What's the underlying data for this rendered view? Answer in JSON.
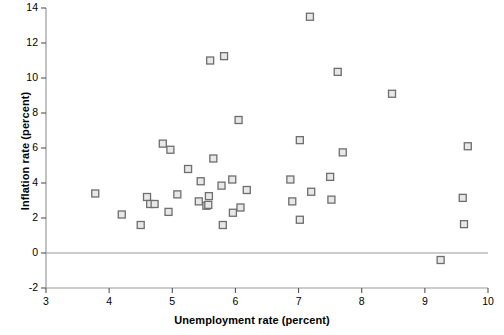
{
  "chart_data": {
    "type": "scatter",
    "title": "",
    "xlabel": "Unemployment rate (percent)",
    "ylabel": "Inflation rate (percent)",
    "xlim": [
      3,
      10
    ],
    "ylim": [
      -2,
      14
    ],
    "xticks": [
      3,
      4,
      5,
      6,
      7,
      8,
      9,
      10
    ],
    "yticks": [
      -2,
      0,
      2,
      4,
      6,
      8,
      10,
      12,
      14
    ],
    "xtick_labels": [
      "3",
      "4",
      "5",
      "6",
      "7",
      "8",
      "9",
      "10"
    ],
    "ytick_labels": [
      "-2",
      "0",
      "2",
      "4",
      "6",
      "8",
      "10",
      "12",
      "14"
    ],
    "grid": false,
    "legend": null,
    "marker": "square",
    "marker_face_color": "#e8e8e8",
    "marker_edge_color": "#6e6e6e",
    "axis_color": "#999999",
    "zero_line": 0,
    "points": [
      {
        "x": 3.78,
        "y": 3.4
      },
      {
        "x": 4.2,
        "y": 2.2
      },
      {
        "x": 4.5,
        "y": 1.6
      },
      {
        "x": 4.6,
        "y": 3.2
      },
      {
        "x": 4.65,
        "y": 2.8
      },
      {
        "x": 4.72,
        "y": 2.8
      },
      {
        "x": 4.85,
        "y": 6.25
      },
      {
        "x": 4.94,
        "y": 2.35
      },
      {
        "x": 4.97,
        "y": 5.9
      },
      {
        "x": 5.08,
        "y": 3.35
      },
      {
        "x": 5.25,
        "y": 4.8
      },
      {
        "x": 5.42,
        "y": 2.95
      },
      {
        "x": 5.45,
        "y": 4.1
      },
      {
        "x": 5.54,
        "y": 2.7
      },
      {
        "x": 5.57,
        "y": 2.75
      },
      {
        "x": 5.58,
        "y": 3.25
      },
      {
        "x": 5.6,
        "y": 11.0
      },
      {
        "x": 5.65,
        "y": 5.4
      },
      {
        "x": 5.78,
        "y": 3.85
      },
      {
        "x": 5.8,
        "y": 1.6
      },
      {
        "x": 5.82,
        "y": 11.25
      },
      {
        "x": 5.95,
        "y": 4.2
      },
      {
        "x": 5.96,
        "y": 2.3
      },
      {
        "x": 6.05,
        "y": 7.6
      },
      {
        "x": 6.08,
        "y": 2.6
      },
      {
        "x": 6.18,
        "y": 3.6
      },
      {
        "x": 6.87,
        "y": 4.2
      },
      {
        "x": 6.9,
        "y": 2.95
      },
      {
        "x": 7.02,
        "y": 1.9
      },
      {
        "x": 7.02,
        "y": 6.45
      },
      {
        "x": 7.18,
        "y": 13.5
      },
      {
        "x": 7.2,
        "y": 3.5
      },
      {
        "x": 7.5,
        "y": 4.35
      },
      {
        "x": 7.52,
        "y": 3.05
      },
      {
        "x": 7.62,
        "y": 10.35
      },
      {
        "x": 7.7,
        "y": 5.75
      },
      {
        "x": 8.48,
        "y": 9.1
      },
      {
        "x": 9.25,
        "y": -0.4
      },
      {
        "x": 9.6,
        "y": 3.15
      },
      {
        "x": 9.62,
        "y": 1.65
      },
      {
        "x": 9.68,
        "y": 6.1
      }
    ]
  },
  "axes": {
    "x_title": "Unemployment rate (percent)",
    "y_title": "Inflation rate (percent)"
  }
}
